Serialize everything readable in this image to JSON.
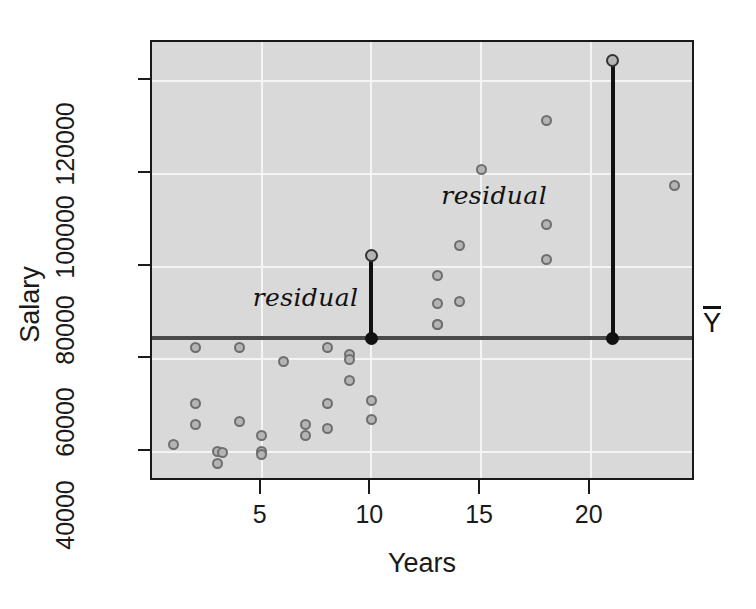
{
  "chart_data": {
    "type": "scatter",
    "title": "",
    "xlabel": "Years",
    "ylabel": "Salary",
    "xlim": [
      0,
      24.8
    ],
    "ylim": [
      33500,
      128500
    ],
    "grid": true,
    "legend": false,
    "xticks": [
      5,
      10,
      15,
      20
    ],
    "xtick_labels": [
      "5",
      "10",
      "15",
      "20"
    ],
    "yticks": [
      40000,
      60000,
      80000,
      100000,
      120000
    ],
    "ytick_labels": [
      "40000",
      "60000",
      "80000",
      "100000",
      "120000"
    ],
    "x": [
      1.0,
      2.0,
      2.0,
      2.0,
      3.0,
      3.0,
      3.2,
      4.0,
      4.0,
      5.0,
      5.0,
      5.0,
      6.0,
      7.0,
      7.0,
      8.0,
      8.0,
      8.0,
      9.0,
      9.0,
      9.0,
      10.0,
      10.0,
      10.0,
      13.0,
      13.0,
      13.0,
      13.0,
      14.0,
      14.0,
      15.0,
      18.0,
      18.0,
      18.0,
      21.0,
      23.8
    ],
    "y": [
      41500,
      62500,
      50500,
      46000,
      40000,
      37500,
      39800,
      62500,
      46500,
      40000,
      39500,
      43500,
      59500,
      46000,
      43500,
      62500,
      50500,
      45000,
      61000,
      60000,
      55500,
      82500,
      51000,
      47000,
      78000,
      72000,
      67500,
      67500,
      84500,
      72500,
      101000,
      111500,
      89000,
      81500,
      124500,
      97500
    ],
    "mean_line": {
      "label": "Ybar",
      "value": 64500,
      "color": "#4a4a4a"
    },
    "annotations": [
      {
        "text": "residual",
        "x": 7.0,
        "y": 73500,
        "style": "italic-script"
      },
      {
        "text": "residual",
        "x": 15.6,
        "y": 95500,
        "style": "italic-script"
      }
    ],
    "residual_segments": [
      {
        "x": 10.0,
        "y_point": 82500,
        "y_mean": 64500,
        "color": "#111111"
      },
      {
        "x": 21.0,
        "y_point": 124500,
        "y_mean": 64500,
        "color": "#111111"
      }
    ],
    "colors": {
      "panel_background": "#d9d9d9",
      "gridline": "#f4f4f4",
      "point_fill": "#b4b4b4",
      "point_stroke": "#6e6e6e",
      "axis": "#1a1a1a",
      "mean_line": "#4a4a4a",
      "residual_line": "#111111",
      "page_background": "#ffffff"
    }
  }
}
